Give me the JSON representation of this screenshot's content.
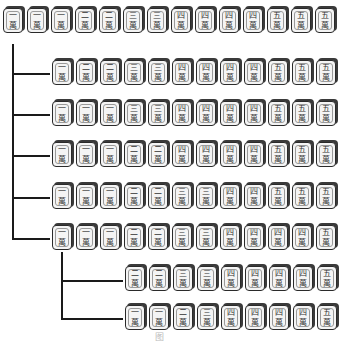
{
  "suit_char": "萬",
  "rows": [
    {
      "name": "root-hand",
      "tiles": [
        "一",
        "一",
        "一",
        "二",
        "二",
        "三",
        "三",
        "四",
        "四",
        "四",
        "四",
        "五",
        "五",
        "五"
      ]
    },
    {
      "name": "branch-1",
      "tiles": [
        "一",
        "二",
        "二",
        "三",
        "三",
        "四",
        "四",
        "四",
        "四",
        "五",
        "五",
        "五"
      ]
    },
    {
      "name": "branch-2",
      "tiles": [
        "一",
        "一",
        "一",
        "三",
        "三",
        "四",
        "四",
        "四",
        "四",
        "五",
        "五",
        "五"
      ]
    },
    {
      "name": "branch-3",
      "tiles": [
        "一",
        "一",
        "一",
        "二",
        "二",
        "四",
        "四",
        "四",
        "四",
        "五",
        "五",
        "五"
      ]
    },
    {
      "name": "branch-4",
      "tiles": [
        "一",
        "一",
        "一",
        "二",
        "二",
        "三",
        "三",
        "四",
        "四",
        "五",
        "五",
        "五"
      ]
    },
    {
      "name": "branch-5",
      "tiles": [
        "一",
        "一",
        "一",
        "二",
        "二",
        "三",
        "三",
        "四",
        "四",
        "四",
        "四",
        "五"
      ]
    },
    {
      "name": "sub-branch-1",
      "tiles": [
        "二",
        "二",
        "三",
        "三",
        "四",
        "四",
        "四",
        "四",
        "五"
      ]
    },
    {
      "name": "sub-branch-2",
      "tiles": [
        "一",
        "一",
        "二",
        "三",
        "四",
        "四",
        "四",
        "四",
        "五"
      ]
    }
  ],
  "caption": "图"
}
